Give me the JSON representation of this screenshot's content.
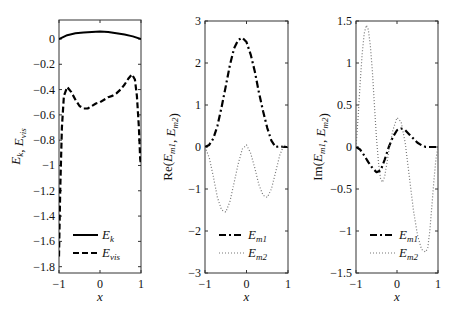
{
  "chart_data": [
    {
      "type": "line",
      "panel": "left",
      "title": "",
      "xlabel": "x",
      "ylabel": "E_k, E_vis",
      "xlim": [
        -1,
        1
      ],
      "ylim": [
        -1.85,
        0.15
      ],
      "xticks": [
        -1,
        0,
        1
      ],
      "yticks": [
        0,
        -0.2,
        -0.4,
        -0.6,
        -0.8,
        -1,
        -1.2,
        -1.4,
        -1.6,
        -1.8
      ],
      "grid": false,
      "legend_position": "lower center",
      "series": [
        {
          "name": "E_k",
          "style": "solid",
          "x": [
            -1,
            -0.8,
            -0.6,
            -0.4,
            -0.2,
            0,
            0.2,
            0.4,
            0.6,
            0.8,
            1
          ],
          "y": [
            0.0,
            0.03,
            0.045,
            0.05,
            0.055,
            0.06,
            0.055,
            0.045,
            0.035,
            0.02,
            0.0
          ]
        },
        {
          "name": "E_vis",
          "style": "dashed",
          "x": [
            -1,
            -0.97,
            -0.93,
            -0.88,
            -0.8,
            -0.7,
            -0.6,
            -0.5,
            -0.4,
            -0.3,
            -0.2,
            -0.1,
            0,
            0.1,
            0.2,
            0.3,
            0.4,
            0.5,
            0.6,
            0.7,
            0.78,
            0.85,
            0.9,
            0.95,
            0.98,
            1
          ],
          "y": [
            -1.72,
            -1.2,
            -0.7,
            -0.45,
            -0.38,
            -0.42,
            -0.48,
            -0.53,
            -0.55,
            -0.55,
            -0.53,
            -0.51,
            -0.5,
            -0.48,
            -0.46,
            -0.45,
            -0.43,
            -0.4,
            -0.36,
            -0.31,
            -0.28,
            -0.32,
            -0.45,
            -0.7,
            -0.95,
            -1.0
          ]
        }
      ]
    },
    {
      "type": "line",
      "panel": "middle",
      "title": "",
      "xlabel": "x",
      "ylabel": "Re(E_m1, E_m2)",
      "xlim": [
        -1,
        1
      ],
      "ylim": [
        -3,
        3
      ],
      "xticks": [
        -1,
        0,
        1
      ],
      "yticks": [
        3,
        2,
        1,
        0,
        -1,
        -2,
        -3
      ],
      "grid": false,
      "legend_position": "lower center",
      "series": [
        {
          "name": "E_m1",
          "style": "dashdot",
          "x": [
            -1,
            -0.9,
            -0.8,
            -0.7,
            -0.6,
            -0.5,
            -0.4,
            -0.3,
            -0.2,
            -0.1,
            0,
            0.1,
            0.2,
            0.3,
            0.4,
            0.5,
            0.6,
            0.7,
            0.8,
            0.9,
            1
          ],
          "y": [
            0.0,
            0.05,
            0.2,
            0.5,
            0.95,
            1.45,
            1.95,
            2.35,
            2.55,
            2.6,
            2.5,
            2.2,
            1.8,
            1.3,
            0.85,
            0.45,
            0.15,
            0.0,
            0.02,
            0.0,
            0.0
          ]
        },
        {
          "name": "E_m2",
          "style": "dotted",
          "x": [
            -1,
            -0.9,
            -0.8,
            -0.7,
            -0.6,
            -0.5,
            -0.4,
            -0.3,
            -0.2,
            -0.1,
            0,
            0.1,
            0.2,
            0.3,
            0.4,
            0.5,
            0.6,
            0.7,
            0.8,
            0.9,
            1
          ],
          "y": [
            0.0,
            -0.25,
            -0.7,
            -1.2,
            -1.5,
            -1.55,
            -1.3,
            -0.85,
            -0.4,
            -0.05,
            0.05,
            -0.15,
            -0.5,
            -0.9,
            -1.15,
            -1.2,
            -1.0,
            -0.6,
            -0.2,
            0.05,
            0.0
          ]
        }
      ]
    },
    {
      "type": "line",
      "panel": "right",
      "title": "",
      "xlabel": "x",
      "ylabel": "Im(E_m1, E_m2)",
      "xlim": [
        -1,
        1
      ],
      "ylim": [
        -1.5,
        1.5
      ],
      "xticks": [
        -1,
        0,
        1
      ],
      "yticks": [
        1.5,
        1,
        0.5,
        0,
        -0.5,
        -1,
        -1.5
      ],
      "grid": false,
      "legend_position": "lower center",
      "series": [
        {
          "name": "E_m1",
          "style": "dashdot",
          "x": [
            -1,
            -0.9,
            -0.8,
            -0.7,
            -0.6,
            -0.5,
            -0.4,
            -0.3,
            -0.2,
            -0.1,
            0,
            0.1,
            0.2,
            0.3,
            0.4,
            0.5,
            0.6,
            0.7,
            0.8,
            0.9,
            1
          ],
          "y": [
            0.0,
            -0.03,
            -0.1,
            -0.18,
            -0.25,
            -0.3,
            -0.28,
            -0.15,
            0.0,
            0.12,
            0.2,
            0.22,
            0.2,
            0.15,
            0.1,
            0.05,
            0.02,
            0.0,
            0.0,
            0.0,
            0.0
          ]
        },
        {
          "name": "E_m2",
          "style": "dotted",
          "x": [
            -1,
            -0.95,
            -0.9,
            -0.85,
            -0.8,
            -0.75,
            -0.7,
            -0.65,
            -0.6,
            -0.55,
            -0.5,
            -0.45,
            -0.4,
            -0.35,
            -0.3,
            -0.25,
            -0.2,
            -0.1,
            0,
            0.1,
            0.2,
            0.3,
            0.4,
            0.5,
            0.6,
            0.7,
            0.75,
            0.8,
            0.85,
            0.9,
            0.95,
            1
          ],
          "y": [
            0.0,
            0.35,
            0.75,
            1.1,
            1.35,
            1.45,
            1.4,
            1.2,
            0.9,
            0.5,
            0.1,
            -0.2,
            -0.38,
            -0.42,
            -0.35,
            -0.2,
            -0.05,
            0.2,
            0.35,
            0.3,
            0.05,
            -0.35,
            -0.75,
            -1.05,
            -1.22,
            -1.25,
            -1.2,
            -1.0,
            -0.7,
            -0.4,
            -0.15,
            0.0
          ]
        }
      ]
    }
  ],
  "panels": [
    {
      "ylabel": "E_k, E_vis",
      "xlabel": "x",
      "legend": [
        {
          "main": "E",
          "sub": "k"
        },
        {
          "main": "E",
          "sub": "vis"
        }
      ]
    },
    {
      "ylabel": "Re(E_m1, E_m2)",
      "xlabel": "x",
      "legend": [
        {
          "main": "E",
          "sub": "m1"
        },
        {
          "main": "E",
          "sub": "m2"
        }
      ]
    },
    {
      "ylabel": "Im(E_m1, E_m2)",
      "xlabel": "x",
      "legend": [
        {
          "main": "E",
          "sub": "m1"
        },
        {
          "main": "E",
          "sub": "m2"
        }
      ]
    }
  ]
}
